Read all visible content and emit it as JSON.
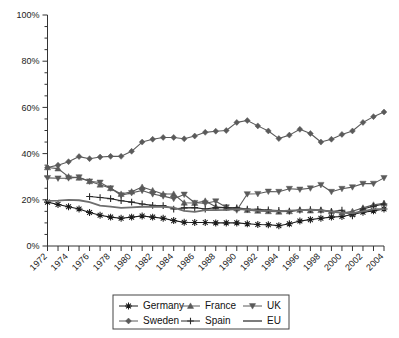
{
  "chart_data": {
    "type": "line",
    "title": "",
    "subtitle": "",
    "xlabel": "",
    "ylabel": "",
    "xlim": [
      1972,
      2004
    ],
    "ylim": [
      0,
      100
    ],
    "y_unit": "%",
    "grid": false,
    "legend_position": "bottom",
    "y_ticks": [
      0,
      20,
      40,
      60,
      80,
      100
    ],
    "y_tick_labels": [
      "0%",
      "20%",
      "40%",
      "60%",
      "80%",
      "100%"
    ],
    "y_minor_tick_step": 5,
    "x_minor_tick_step": 1,
    "x": [
      1972,
      1973,
      1974,
      1975,
      1976,
      1977,
      1978,
      1979,
      1980,
      1981,
      1982,
      1983,
      1984,
      1985,
      1986,
      1987,
      1988,
      1989,
      1990,
      1991,
      1992,
      1993,
      1994,
      1995,
      1996,
      1997,
      1998,
      1999,
      2000,
      2001,
      2002,
      2003,
      2004
    ],
    "x_tick_labels": [
      "1972",
      "1974",
      "1976",
      "1978",
      "1980",
      "1982",
      "1984",
      "1986",
      "1988",
      "1990",
      "1992",
      "1994",
      "1996",
      "1998",
      "2000",
      "2002",
      "2004"
    ],
    "series": [
      {
        "name": "Germany",
        "marker": "asterisk",
        "color": "#1a1a1a",
        "values": [
          19.0,
          18.0,
          17.0,
          16.0,
          14.5,
          13.3,
          12.5,
          12.0,
          12.5,
          13.0,
          12.5,
          12.0,
          11.0,
          10.3,
          10.2,
          10.2,
          10.0,
          10.0,
          10.0,
          9.6,
          9.3,
          9.2,
          8.8,
          9.6,
          10.8,
          11.4,
          12.0,
          12.5,
          12.8,
          13.6,
          14.6,
          15.2,
          16.0
        ]
      },
      {
        "name": "France",
        "marker": "triangle-up",
        "color": "#5a5a5a",
        "values": [
          34.0,
          33.5,
          30.0,
          29.5,
          28.0,
          26.5,
          25.0,
          22.5,
          23.5,
          25.5,
          24.0,
          22.5,
          22.5,
          18.7,
          18.6,
          19.5,
          17.0,
          16.5,
          16.3,
          15.5,
          15.2,
          15.0,
          14.8,
          15.0,
          15.6,
          15.3,
          15.5,
          15.0,
          14.3,
          15.0,
          16.5,
          17.8,
          18.5
        ]
      },
      {
        "name": "UK",
        "marker": "triangle-down",
        "color": "#5a5a5a",
        "values": [
          29.5,
          29.3,
          29.4,
          29.8,
          28.0,
          27.5,
          25.0,
          22.0,
          23.0,
          24.0,
          22.5,
          21.6,
          20.5,
          22.3,
          18.7,
          18.5,
          19.4,
          16.8,
          15.5,
          22.5,
          22.6,
          23.6,
          23.5,
          24.8,
          24.5,
          25.0,
          26.5,
          23.5,
          24.8,
          25.5,
          27.0,
          27.0,
          29.5
        ]
      },
      {
        "name": "Sweden",
        "marker": "diamond",
        "color": "#5a5a5a",
        "values": [
          34.0,
          35.0,
          36.5,
          38.7,
          37.8,
          38.5,
          38.8,
          38.8,
          41.0,
          45.0,
          46.2,
          47.0,
          47.0,
          46.4,
          47.6,
          49.2,
          49.7,
          50.0,
          53.5,
          54.3,
          52.0,
          49.8,
          46.5,
          48.0,
          50.5,
          48.7,
          45.0,
          46.2,
          48.3,
          49.8,
          53.5,
          56.0,
          58.0
        ]
      },
      {
        "name": "Spain",
        "marker": "plus",
        "color": "#2a2a2a",
        "values": [
          null,
          null,
          null,
          null,
          21.4,
          21.0,
          20.5,
          19.6,
          19.0,
          18.2,
          17.6,
          17.5,
          16.0,
          16.5,
          16.6,
          16.0,
          16.6,
          16.6,
          16.5,
          16.0,
          15.9,
          15.6,
          15.4,
          15.1,
          15.5,
          15.8,
          15.5,
          14.9,
          15.5,
          13.0,
          16.0,
          17.2,
          18.2
        ]
      },
      {
        "name": "EU",
        "marker": "none",
        "color": "#6e6e6e",
        "values": [
          19.5,
          19.6,
          20.0,
          19.8,
          19.0,
          17.5,
          17.0,
          16.5,
          16.7,
          17.0,
          17.0,
          17.0,
          16.6,
          15.2,
          14.8,
          15.5,
          15.5,
          15.6,
          16.0,
          15.8,
          15.3,
          15.3,
          15.1,
          15.3,
          15.5,
          15.7,
          15.5,
          14.9,
          14.4,
          14.2,
          15.0,
          16.0,
          16.0
        ]
      }
    ]
  },
  "legend": {
    "entries": [
      {
        "label": "Germany",
        "marker": "asterisk"
      },
      {
        "label": "France",
        "marker": "triangle-up"
      },
      {
        "label": "UK",
        "marker": "triangle-down"
      },
      {
        "label": "Sweden",
        "marker": "diamond"
      },
      {
        "label": "Spain",
        "marker": "plus"
      },
      {
        "label": "EU",
        "marker": "none"
      }
    ]
  },
  "colors": {
    "axis": "#333333",
    "text": "#222222",
    "background": "#ffffff",
    "dark_series": "#1a1a1a",
    "gray_series": "#5a5a5a"
  }
}
